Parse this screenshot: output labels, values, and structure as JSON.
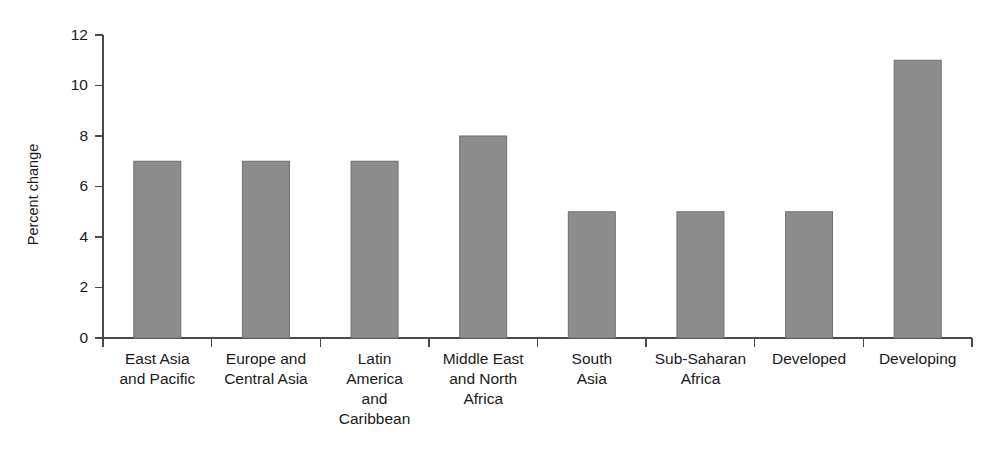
{
  "chart_data": {
    "type": "bar",
    "title": "",
    "subtitle": "",
    "xlabel": "",
    "ylabel": "Percent change",
    "categories": [
      "East Asia and Pacific",
      "Europe and Central Asia",
      "Latin America and Caribbean",
      "Middle East and North Africa",
      "South Asia",
      "Sub-Saharan Africa",
      "Developed",
      "Developing"
    ],
    "category_label_lines": [
      [
        "East Asia",
        "and Pacific"
      ],
      [
        "Europe and",
        "Central Asia"
      ],
      [
        "Latin",
        "America",
        "and",
        "Caribbean"
      ],
      [
        "Middle East",
        "and North",
        "Africa"
      ],
      [
        "South",
        "Asia"
      ],
      [
        "Sub-Saharan",
        "Africa"
      ],
      [
        "Developed"
      ],
      [
        "Developing"
      ]
    ],
    "values": [
      7,
      7,
      7,
      8,
      5,
      5,
      5,
      11
    ],
    "ylim": [
      0,
      12
    ],
    "yticks": [
      0,
      2,
      4,
      6,
      8,
      10,
      12
    ],
    "ytick_labels": [
      "0",
      "2",
      "4",
      "6",
      "8",
      "10",
      "12"
    ],
    "grid": false,
    "legend": false,
    "legend_position": "none",
    "bar_color": "#8d8d8d",
    "bar_edge_color": "#6f6f6f",
    "axis_color": "#4a4a4a",
    "text_color": "#1a1a1a",
    "background": "#ffffff"
  }
}
